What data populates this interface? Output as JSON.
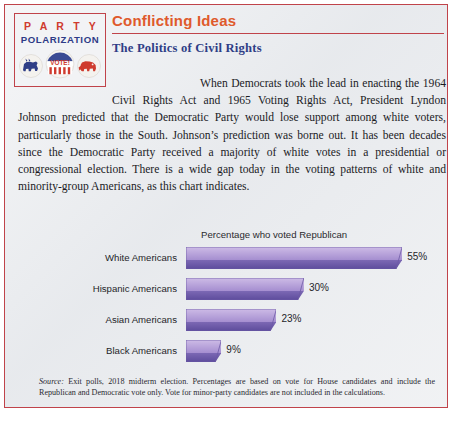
{
  "logo": {
    "line1": "P A R T Y",
    "line2": "POLARIZATION",
    "badge_text": "VOTE!",
    "colors": {
      "party_red": "#cf3b2e",
      "polarization_blue": "#2e3b87",
      "donkey_blue": "#2f3e86",
      "elephant_red": "#cf3b2e"
    }
  },
  "header": {
    "feature_title": "Conflicting Ideas",
    "sub_title": "The Politics of Civil Rights",
    "title_color": "#df5a2c",
    "subtitle_color": "#2f3e86",
    "rule_color": "#c0434a"
  },
  "body": {
    "paragraph": "When Democrats took the lead in enacting the 1964 Civil Rights Act and 1965 Voting Rights Act, President Lyndon Johnson predicted that the Democratic Party would lose support among white voters, particularly those in the South. Johnson’s prediction was borne out. It has been decades since the Democratic Party received a majority of white votes in a presidential or congressional election. There is a wide gap today in the voting patterns of white and minority-group Americans, as this chart indicates."
  },
  "chart_data": {
    "type": "bar",
    "orientation": "horizontal",
    "title": "Percentage who voted Republican",
    "categories": [
      "White Americans",
      "Hispanic Americans",
      "Asian Americans",
      "Black Americans"
    ],
    "values": [
      55,
      30,
      23,
      9
    ],
    "value_labels": [
      "55%",
      "30%",
      "23%",
      "9%"
    ],
    "xlabel": "",
    "ylabel": "",
    "xlim": [
      0,
      60
    ],
    "grid": false,
    "legend": "none",
    "bar_color_top": "#b49ad8",
    "bar_color_bottom": "#6a57a8",
    "bar_color_edge": "#5a4a96"
  },
  "source_note": {
    "label": "Source:",
    "text": " Exit polls, 2018 midterm election. Percentages are  based on vote for House candidates and include the Republican and Democratic vote only. Vote for minor-party candidates are not included in the calculations."
  },
  "bleed": {
    "partial_line": " "
  }
}
